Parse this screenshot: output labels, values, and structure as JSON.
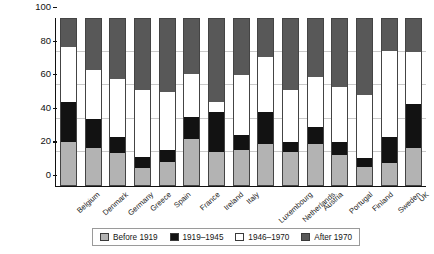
{
  "chart_data": {
    "type": "bar",
    "subtype": "stacked-bar-100",
    "title": "",
    "xlabel": "",
    "ylabel": "Age of dwelling stock (%)",
    "ylim": [
      0,
      100
    ],
    "yticks": [
      0,
      20,
      40,
      60,
      80,
      100
    ],
    "grid": true,
    "legend_position": "bottom",
    "categories": [
      "Belgium",
      "Denmark",
      "Germany",
      "Greece",
      "Spain",
      "France",
      "Ireland",
      "Italy",
      "Luxembourg",
      "Netherlands",
      "Austria",
      "Portugal",
      "Finland",
      "Sweden",
      "UK"
    ],
    "series": [
      {
        "name": "Before 1919",
        "color": "#b3b3b3",
        "values": [
          26,
          22,
          19,
          10,
          14,
          28,
          20,
          21,
          25,
          20,
          25,
          18,
          11,
          13,
          22
        ]
      },
      {
        "name": "1919–1945",
        "color": "#121212",
        "values": [
          24,
          18,
          10,
          7,
          7,
          13,
          24,
          9,
          19,
          6,
          10,
          8,
          5,
          16,
          27
        ]
      },
      {
        "name": "1946–1970",
        "color": "#ffffff",
        "values": [
          33,
          29,
          35,
          40,
          35,
          26,
          6,
          36,
          33,
          31,
          30,
          33,
          38,
          52,
          31
        ]
      },
      {
        "name": "After 1970",
        "color": "#585858",
        "values": [
          17,
          31,
          36,
          43,
          44,
          33,
          50,
          34,
          23,
          43,
          35,
          41,
          46,
          19,
          20
        ]
      }
    ]
  },
  "legend": {
    "items": [
      {
        "label": "Before 1919",
        "swatch": "s0"
      },
      {
        "label": "1919–1945",
        "swatch": "s1"
      },
      {
        "label": "1946–1970",
        "swatch": "s2"
      },
      {
        "label": "After 1970",
        "swatch": "s3"
      }
    ]
  }
}
